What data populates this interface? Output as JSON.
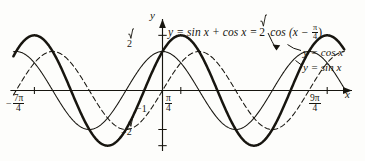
{
  "figure": {
    "kind": "trigonometric-graph",
    "background": "#fdfdfb",
    "ink": "#17150f"
  },
  "labels": {
    "main_equation_plain": "y = sin x + cos x = √2 cos (x − π/4)",
    "main_eq_lhs": "y = sin x + cos x = ",
    "main_eq_sqrt": "2",
    "main_eq_cos": " cos (x − ",
    "main_eq_close": ")",
    "curve_cos": "y = cos x",
    "curve_sin": "y = sin x",
    "axis_y": "y",
    "axis_x": "x"
  },
  "ticks": {
    "x": [
      {
        "label_plain": "−7π/4",
        "num": "7π",
        "den": "4",
        "sign": "−",
        "value": -5.497787,
        "px": 25
      },
      {
        "label_plain": "π/4",
        "num": "π",
        "den": "4",
        "sign": "",
        "value": 0.785398,
        "px": 172
      },
      {
        "label_plain": "9π/4",
        "num": "9π",
        "den": "4",
        "sign": "",
        "value": 7.068583,
        "px": 318
      }
    ],
    "y": [
      {
        "label_plain": "√2",
        "value": 1.414214,
        "px": 35
      },
      {
        "label_plain": "−1",
        "value": -1,
        "px": 112
      },
      {
        "label_plain": "−√2",
        "value": -1.414214,
        "px": 124
      }
    ]
  },
  "chart_data": {
    "type": "line",
    "xlabel": "x",
    "ylabel": "y",
    "xlim": [
      -6.4,
      7.8
    ],
    "ylim": [
      -1.55,
      1.55
    ],
    "grid": false,
    "legend": "inline-annotations",
    "x_tick_labels": [
      "−7π/4",
      "π/4",
      "9π/4"
    ],
    "x_tick_values": [
      -5.497787,
      0.785398,
      7.068583
    ],
    "y_tick_labels": [
      "√2",
      "−1",
      "−√2"
    ],
    "y_tick_values": [
      1.414214,
      -1,
      -1.414214
    ],
    "series": [
      {
        "name": "y = sin x + cos x = √2 cos (x − π/4)",
        "style": "solid-bold",
        "amplitude": 1.414214,
        "phase": 0.785398,
        "function": "sqrt(2)*cos(x - pi/4)",
        "maxima_x": [
          -5.497787,
          0.785398,
          7.068583
        ],
        "minima_x": [
          -2.356194,
          3.926991
        ],
        "zeros_x": [
          -3.926991,
          -0.785398,
          2.356194,
          5.497787
        ]
      },
      {
        "name": "y = cos x",
        "style": "solid-thin",
        "amplitude": 1,
        "phase": 0,
        "function": "cos(x)",
        "maxima_x": [
          -6.283185,
          0,
          6.283185
        ],
        "minima_x": [
          -3.141593,
          3.141593
        ],
        "zeros_x": [
          -4.712389,
          -1.570796,
          1.570796,
          4.712389
        ]
      },
      {
        "name": "y = sin x",
        "style": "dashed",
        "amplitude": 1,
        "phase": 1.570796,
        "function": "sin(x)",
        "maxima_x": [
          -4.712389,
          1.570796,
          7.853982
        ],
        "minima_x": [
          -1.570796,
          4.712389
        ],
        "zeros_x": [
          -6.283185,
          -3.141593,
          0,
          3.141593,
          6.283185
        ]
      }
    ]
  }
}
